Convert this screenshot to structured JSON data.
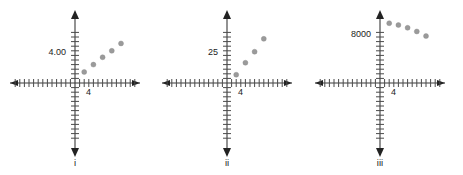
{
  "figure": {
    "background": "#ffffff",
    "axis_color": "#3a3a3a",
    "tick_color": "#4a4a4a",
    "point_color": "#9a9a9a",
    "text_color": "#222222"
  },
  "chart_data": [
    {
      "type": "scatter",
      "title": "i",
      "panel_label": "i",
      "xlabel": "4",
      "ylabel": "4.00",
      "y_axis_label_value": "4.00",
      "x_axis_label_value": "4",
      "grid": false,
      "legend": "none",
      "axis_style": "four-quadrant-tick-axes",
      "x_ticks_left": 13,
      "x_ticks_right": 13,
      "y_ticks_up": 11,
      "y_ticks_down": 12,
      "x": [
        1,
        2,
        3,
        4,
        5
      ],
      "y": [
        1.2,
        2.0,
        2.8,
        3.5,
        4.3
      ],
      "points_px": [
        {
          "x": 1,
          "y": 1.2
        },
        {
          "x": 2,
          "y": 2.0
        },
        {
          "x": 3,
          "y": 2.8
        },
        {
          "x": 4,
          "y": 3.5
        },
        {
          "x": 5,
          "y": 4.3
        }
      ],
      "trend": "increasing-linear"
    },
    {
      "type": "scatter",
      "title": "ii",
      "panel_label": "ii",
      "xlabel": "4",
      "ylabel": "25",
      "y_axis_label_value": "25",
      "x_axis_label_value": "4",
      "grid": false,
      "legend": "none",
      "axis_style": "four-quadrant-tick-axes",
      "x_ticks_left": 13,
      "x_ticks_right": 13,
      "y_ticks_up": 11,
      "y_ticks_down": 12,
      "x": [
        1,
        2,
        3,
        4
      ],
      "y": [
        0.9,
        2.2,
        3.4,
        4.8
      ],
      "points_px": [
        {
          "x": 1,
          "y": 0.9
        },
        {
          "x": 2,
          "y": 2.2
        },
        {
          "x": 3,
          "y": 3.4
        },
        {
          "x": 4,
          "y": 4.8
        }
      ],
      "trend": "increasing-steep"
    },
    {
      "type": "scatter",
      "title": "iii",
      "panel_label": "iii",
      "xlabel": "4",
      "ylabel": "8000",
      "y_axis_label_value": "8000",
      "x_axis_label_value": "4",
      "grid": false,
      "legend": "none",
      "axis_style": "four-quadrant-tick-axes",
      "x_ticks_left": 13,
      "x_ticks_right": 13,
      "y_ticks_up": 11,
      "y_ticks_down": 12,
      "x": [
        1,
        2,
        3,
        4,
        5
      ],
      "y": [
        6.5,
        6.3,
        6.0,
        5.6,
        5.1
      ],
      "points_px": [
        {
          "x": 1,
          "y": 6.5
        },
        {
          "x": 2,
          "y": 6.3
        },
        {
          "x": 3,
          "y": 6.0
        },
        {
          "x": 4,
          "y": 5.6
        },
        {
          "x": 5,
          "y": 5.1
        }
      ],
      "trend": "decreasing-shallow"
    }
  ],
  "panels": [
    {
      "roman": "i",
      "y_label": "4.00",
      "x_label": "4"
    },
    {
      "roman": "ii",
      "y_label": "25",
      "x_label": "4"
    },
    {
      "roman": "iii",
      "y_label": "8000",
      "x_label": "4"
    }
  ]
}
